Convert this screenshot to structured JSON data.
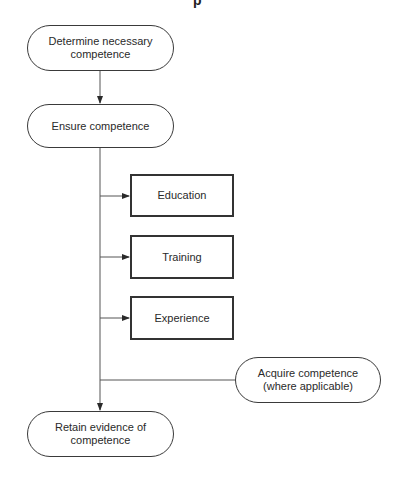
{
  "diagram": {
    "top_fragment": "p",
    "nodes": {
      "determine": {
        "label": "Determine necessary\ncompetence",
        "shape": "terminal"
      },
      "ensure": {
        "label": "Ensure competence",
        "shape": "terminal"
      },
      "education": {
        "label": "Education",
        "shape": "process"
      },
      "training": {
        "label": "Training",
        "shape": "process"
      },
      "experience": {
        "label": "Experience",
        "shape": "process"
      },
      "acquire": {
        "label": "Acquire competence\n(where applicable)",
        "shape": "terminal"
      },
      "retain": {
        "label": "Retain evidence of\ncompetence",
        "shape": "terminal"
      }
    },
    "edges": [
      {
        "from": "determine",
        "to": "ensure",
        "arrow": true
      },
      {
        "from": "ensure",
        "to": "education",
        "arrow": true
      },
      {
        "from": "ensure",
        "to": "training",
        "arrow": true
      },
      {
        "from": "ensure",
        "to": "experience",
        "arrow": true
      },
      {
        "from": "acquire",
        "to": "main-line",
        "arrow": false
      },
      {
        "from": "ensure",
        "to": "retain",
        "arrow": true
      }
    ],
    "colors": {
      "stroke": "#3a3a3a",
      "text": "#2a2a2a",
      "background": "#ffffff"
    }
  }
}
